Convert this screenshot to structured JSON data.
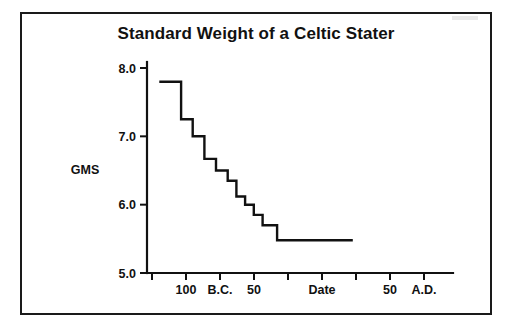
{
  "figure": {
    "title": "Standard Weight of a Celtic Stater",
    "background_color": "#ffffff",
    "ink_color": "#111111",
    "frame_color": "#1a1a1a"
  },
  "chart_data": {
    "type": "line",
    "title": "Standard Weight of a Celtic Stater",
    "subtitle": "",
    "xlabel": "Date",
    "ylabel": "GMS",
    "line_style": "step-post",
    "grid": false,
    "legend": null,
    "xlim": [
      130,
      -70
    ],
    "ylim": [
      5.0,
      8.0
    ],
    "x_axis_direction": "decreasing-BC-to-increasing-AD",
    "ytick_labels": [
      "8.0",
      "7.0",
      "6.0",
      "5.0"
    ],
    "ytick_values": [
      8.0,
      7.0,
      6.0,
      5.0
    ],
    "xtick_count": 10,
    "xtick_labels": [
      "",
      "100",
      "B.C.",
      "50",
      "",
      "Date",
      "",
      "50",
      "A.D.",
      ""
    ],
    "xtick_values": [
      125,
      110,
      95,
      80,
      65,
      50,
      35,
      20,
      5,
      -10
    ],
    "annotations": [
      "B.C.",
      "A.D.",
      "Date",
      "GMS"
    ],
    "x": [
      125,
      110,
      102,
      94,
      86,
      78,
      72,
      66,
      60,
      54,
      44,
      30,
      -8
    ],
    "values": [
      7.8,
      7.8,
      7.25,
      7.0,
      6.67,
      6.5,
      6.35,
      6.12,
      6.0,
      5.85,
      5.7,
      5.48,
      5.48
    ],
    "series": [
      {
        "name": "Standard weight",
        "units": "grams",
        "steps": [
          {
            "x_start": 125,
            "x_end": 110,
            "value": 7.8
          },
          {
            "x_start": 110,
            "x_end": 102,
            "value": 7.25
          },
          {
            "x_start": 102,
            "x_end": 94,
            "value": 7.0
          },
          {
            "x_start": 94,
            "x_end": 86,
            "value": 6.67
          },
          {
            "x_start": 86,
            "x_end": 78,
            "value": 6.5
          },
          {
            "x_start": 78,
            "x_end": 72,
            "value": 6.35
          },
          {
            "x_start": 72,
            "x_end": 66,
            "value": 6.12
          },
          {
            "x_start": 66,
            "x_end": 60,
            "value": 6.0
          },
          {
            "x_start": 60,
            "x_end": 54,
            "value": 5.85
          },
          {
            "x_start": 54,
            "x_end": 44,
            "value": 5.7
          },
          {
            "x_start": 44,
            "x_end": -8,
            "value": 5.48
          }
        ]
      }
    ]
  },
  "geometry": {
    "plot_left": 147,
    "plot_right": 453,
    "plot_top": 68,
    "plot_bottom": 273,
    "data_start_x": 152,
    "data_end_x": 443,
    "y_axis_top_overshoot": 62,
    "tick_spacing_px": 34,
    "tick_length_px": 7,
    "ytick_length_px": 7
  }
}
